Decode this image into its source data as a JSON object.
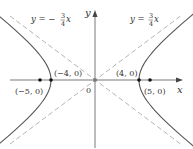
{
  "figure": {
    "type": "hyperbola",
    "equation": "x^2/16 - y^2/9 = 1",
    "axes": {
      "x_label": "x",
      "y_label": "y",
      "origin_label": "0"
    },
    "asymptotes": [
      {
        "id": "neg",
        "label_prefix": "y = −",
        "num": "3",
        "den": "4",
        "var": "x",
        "slope": -0.75
      },
      {
        "id": "pos",
        "label_prefix": "y = ",
        "num": "3",
        "den": "4",
        "var": "x",
        "slope": 0.75
      }
    ],
    "points": [
      {
        "id": "focus-left",
        "label": "(−5, 0)",
        "x": -5,
        "y": 0
      },
      {
        "id": "vertex-left",
        "label": "(−4, 0)",
        "x": -4,
        "y": 0
      },
      {
        "id": "vertex-right",
        "label": "(4, 0)",
        "x": 4,
        "y": 0
      },
      {
        "id": "focus-right",
        "label": "(5, 0)",
        "x": 5,
        "y": 0
      }
    ],
    "a": 4,
    "b": 3,
    "colors": {
      "curve": "#555555",
      "asymptote": "#aaaaaa",
      "axis": "#555555",
      "text": "#333333"
    }
  }
}
